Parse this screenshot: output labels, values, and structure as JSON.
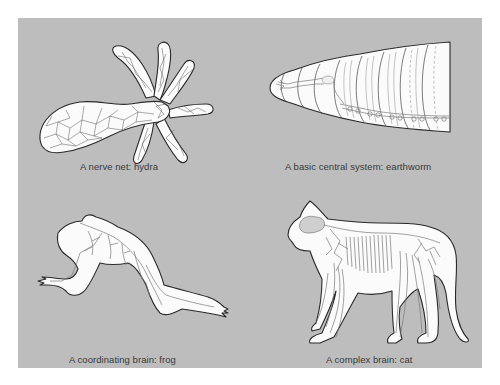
{
  "figure": {
    "background_color": "#bdbdbd",
    "page_color": "#ffffff",
    "panels": [
      {
        "id": "hydra",
        "caption": "A nerve net: hydra",
        "organism": "hydra",
        "nervous_system_type": "nerve net"
      },
      {
        "id": "earthworm",
        "caption": "A basic central system: earthworm",
        "organism": "earthworm",
        "nervous_system_type": "basic central system"
      },
      {
        "id": "frog",
        "caption": "A coordinating brain: frog",
        "organism": "frog",
        "nervous_system_type": "coordinating brain"
      },
      {
        "id": "cat",
        "caption": "A complex brain: cat",
        "organism": "cat",
        "nervous_system_type": "complex brain"
      }
    ]
  }
}
